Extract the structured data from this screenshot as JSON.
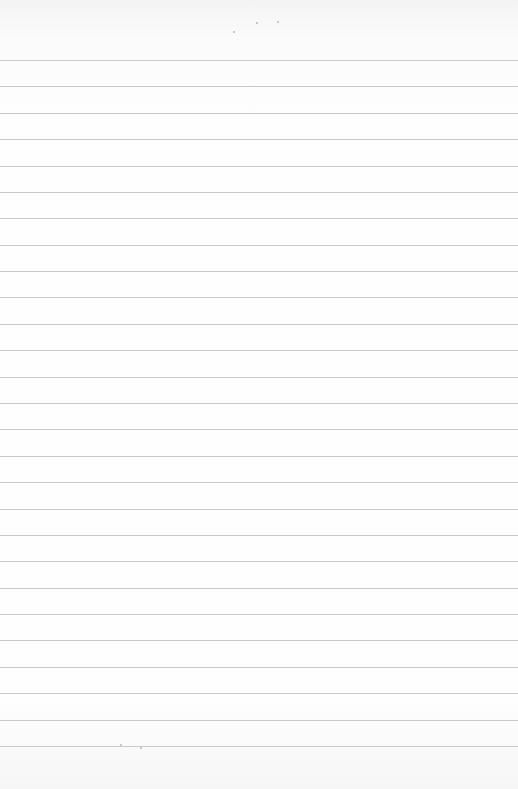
{
  "page": {
    "kind": "blank ruled paper",
    "rule_count": 27,
    "rule_color": "#c9c9c9",
    "paper_color": "#fefefe",
    "text": ""
  }
}
